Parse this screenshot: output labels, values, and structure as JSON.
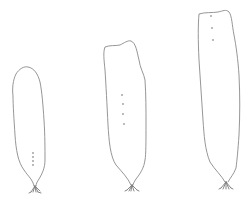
{
  "figure": {
    "background_color": "#ffffff",
    "stroke_color": "#8a8a8a",
    "specimens": [
      {
        "id": "blade-1",
        "dots": 4,
        "position": "left"
      },
      {
        "id": "blade-2",
        "dots": 4,
        "position": "center"
      },
      {
        "id": "blade-3",
        "dots": 3,
        "position": "right"
      }
    ]
  }
}
